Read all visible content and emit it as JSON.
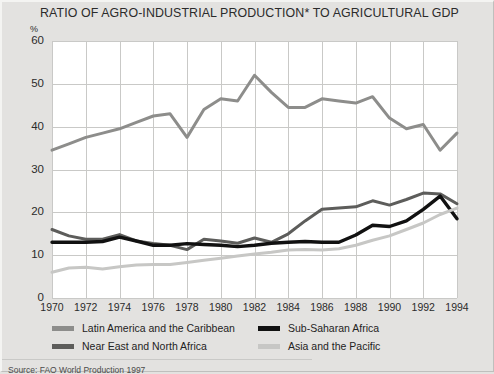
{
  "chart_data": {
    "type": "line",
    "title": "RATIO OF AGRO-INDUSTRIAL PRODUCTION* TO AGRICULTURAL GDP",
    "xlabel": "",
    "ylabel": "%",
    "ylim": [
      0,
      60
    ],
    "xlim": [
      1970,
      1994
    ],
    "ytick_step": 10,
    "xtick_step": 2,
    "grid": true,
    "legend_position": "below",
    "yticks": [
      "0",
      "10",
      "20",
      "30",
      "40",
      "50",
      "60"
    ],
    "xticks": [
      "1970",
      "1972",
      "1974",
      "1976",
      "1978",
      "1980",
      "1982",
      "1984",
      "1986",
      "1988",
      "1990",
      "1992",
      "1994"
    ],
    "x": [
      1970,
      1971,
      1972,
      1973,
      1974,
      1975,
      1976,
      1977,
      1978,
      1979,
      1980,
      1981,
      1982,
      1983,
      1984,
      1985,
      1986,
      1987,
      1988,
      1989,
      1990,
      1991,
      1992,
      1993,
      1994
    ],
    "series": [
      {
        "name": "Latin America and the Caribbean",
        "color": "#8d8d8b",
        "values": [
          34.5,
          36.0,
          37.5,
          38.5,
          39.5,
          41.0,
          42.5,
          43.0,
          37.5,
          44.0,
          46.5,
          46.0,
          52.0,
          48.0,
          44.5,
          44.5,
          46.5,
          46.0,
          45.5,
          47.0,
          42.0,
          39.5,
          40.5,
          34.5,
          38.5
        ]
      },
      {
        "name": "Near East and North Africa",
        "color": "#5d5d5b",
        "values": [
          16.0,
          14.5,
          13.7,
          13.7,
          14.8,
          13.3,
          12.7,
          12.3,
          11.3,
          13.7,
          13.3,
          12.8,
          14.0,
          13.0,
          15.0,
          18.0,
          20.7,
          21.0,
          21.3,
          22.7,
          21.7,
          23.0,
          24.5,
          24.3,
          22.0
        ]
      },
      {
        "name": "Sub-Saharan Africa",
        "color": "#111111",
        "values": [
          13.0,
          13.0,
          13.0,
          13.2,
          14.2,
          13.3,
          12.3,
          12.3,
          12.7,
          12.5,
          12.3,
          12.0,
          12.3,
          12.8,
          13.0,
          13.2,
          13.0,
          13.0,
          14.7,
          17.0,
          16.7,
          18.0,
          20.7,
          23.8,
          18.5
        ]
      },
      {
        "name": "Asia and the Pacific",
        "color": "#c7c7c5",
        "values": [
          6.0,
          7.0,
          7.2,
          6.8,
          7.3,
          7.7,
          7.8,
          7.8,
          8.3,
          8.8,
          9.3,
          9.8,
          10.3,
          10.7,
          11.2,
          11.3,
          11.2,
          11.5,
          12.3,
          13.5,
          14.5,
          16.0,
          17.5,
          19.5,
          21.0
        ]
      }
    ]
  },
  "footnote_marker": "*",
  "source": {
    "text": "Source: FAO World Production 1997"
  },
  "legend": {
    "items": [
      {
        "label": "Latin America and the Caribbean",
        "color": "#8d8d8b"
      },
      {
        "label": "Near East and North Africa",
        "color": "#5d5d5b"
      },
      {
        "label": "Sub-Saharan Africa",
        "color": "#111111"
      },
      {
        "label": "Asia and the Pacific",
        "color": "#c7c7c5"
      }
    ]
  }
}
